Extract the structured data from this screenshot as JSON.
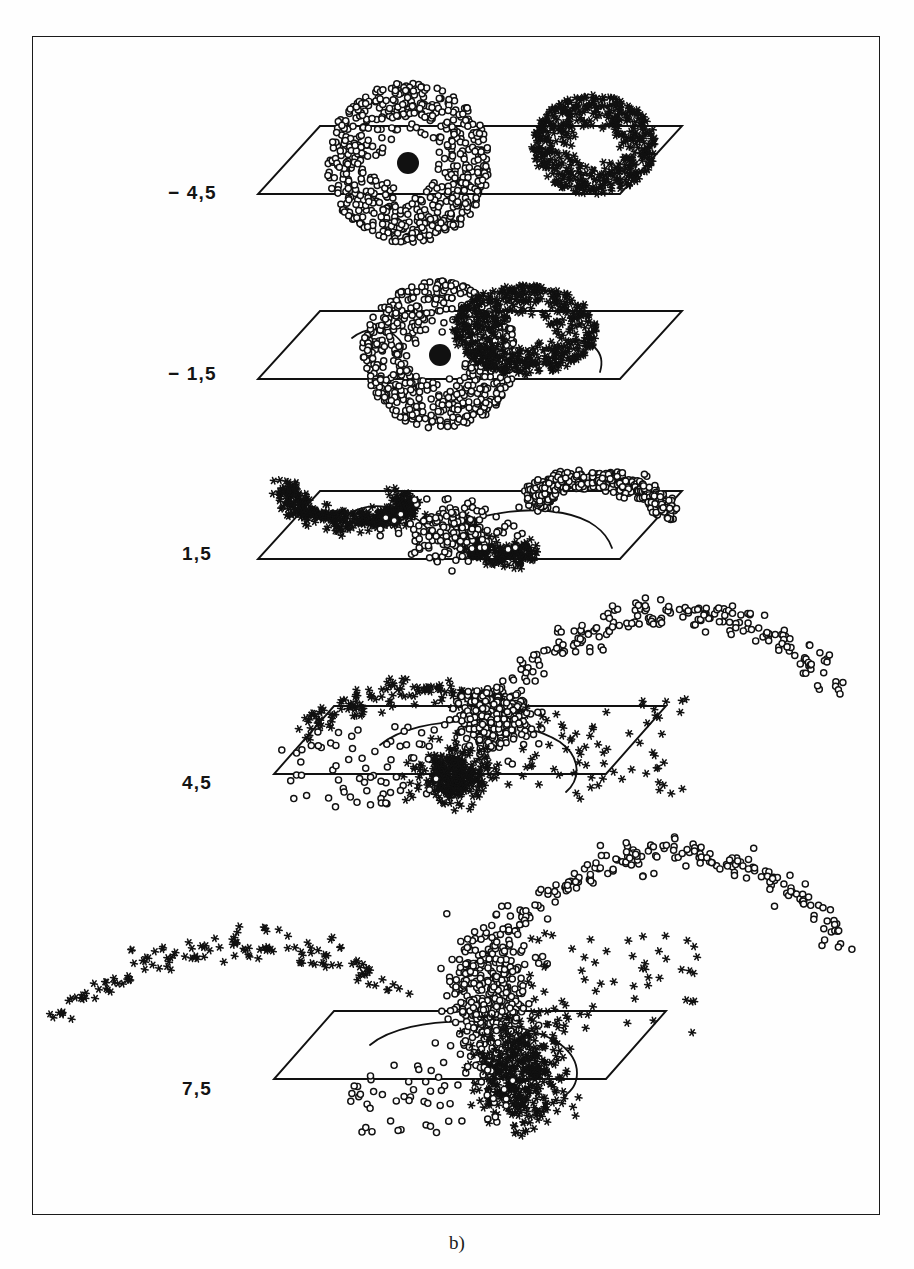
{
  "page": {
    "header_text": "",
    "caption": "b)",
    "background_color": "#fdfdfc",
    "ink_color": "#111111",
    "frame": {
      "color": "#1b1b1b"
    }
  },
  "figure": {
    "label": "b)",
    "type": "multi-panel 3d scatter",
    "marker_series": [
      {
        "name": "circles",
        "glyph": "open-circle",
        "color": "#111111"
      },
      {
        "name": "asterisks",
        "glyph": "six-point-asterisk",
        "color": "#111111"
      }
    ],
    "panel_value_label_prefix": "",
    "panels": [
      {
        "id": "panel-1",
        "label": "− 4,5",
        "value": -4.5
      },
      {
        "id": "panel-2",
        "label": "− 1,5",
        "value": -1.5
      },
      {
        "id": "panel-3",
        "label": "1,5",
        "value": 1.5
      },
      {
        "id": "panel-4",
        "label": "4,5",
        "value": 4.5
      },
      {
        "id": "panel-5",
        "label": "7,5",
        "value": 7.5
      }
    ]
  },
  "chart_data": {
    "type": "scatter",
    "title": "",
    "subtitle": "",
    "xlabel": "",
    "ylabel": "",
    "grid": false,
    "legend_position": "none",
    "annotations": [
      "− 4,5",
      "− 1,5",
      "1,5",
      "4,5",
      "7,5",
      "b)"
    ],
    "panel_parameter_values": [
      -4.5,
      -1.5,
      1.5,
      4.5,
      7.5
    ],
    "series": [
      {
        "name": "circles",
        "marker": "open-circle",
        "n_panels": 5
      },
      {
        "name": "asterisks",
        "marker": "six-point-asterisk",
        "n_panels": 5
      }
    ],
    "panels": [
      {
        "label": "− 4,5",
        "plane": {
          "cx": 470,
          "cy": 160,
          "hw": 212,
          "hh": 34,
          "skew": 62
        },
        "clusters": [
          {
            "series": "circles",
            "shape": "disc",
            "cx": 408,
            "cy": 163,
            "rx": 82,
            "ry": 80,
            "n": 620,
            "hole": 12,
            "core": 11
          },
          {
            "series": "asterisks",
            "shape": "disc",
            "cx": 594,
            "cy": 145,
            "rx": 62,
            "ry": 50,
            "n": 520,
            "hole": 0,
            "core": 0
          }
        ],
        "curves": [],
        "arcs": []
      },
      {
        "label": "− 1,5",
        "plane": {
          "cx": 470,
          "cy": 345,
          "hw": 212,
          "hh": 34,
          "skew": 62
        },
        "clusters": [
          {
            "series": "circles",
            "shape": "disc",
            "cx": 440,
            "cy": 355,
            "rx": 78,
            "ry": 74,
            "n": 600,
            "hole": 13,
            "core": 11
          },
          {
            "series": "asterisks",
            "shape": "disc",
            "cx": 525,
            "cy": 330,
            "rx": 72,
            "ry": 45,
            "n": 560,
            "hole": 0,
            "core": 0
          }
        ],
        "curves": [
          {
            "kind": "separatrix",
            "d": "M 352 338 C 372 322 398 330 404 348"
          },
          {
            "kind": "separatrix",
            "d": "M 566 340 C 592 338 606 352 600 372"
          }
        ],
        "arcs": []
      },
      {
        "label": "1,5",
        "plane": {
          "cx": 470,
          "cy": 525,
          "hw": 212,
          "hh": 34,
          "skew": 62
        },
        "clusters": [
          {
            "series": "asterisks",
            "shape": "arm-left",
            "cx": 385,
            "cy": 498,
            "n": 430
          },
          {
            "series": "circles",
            "shape": "arm-right",
            "cx": 560,
            "cy": 505,
            "n": 430
          },
          {
            "series": "asterisks",
            "shape": "arm-low",
            "cx": 530,
            "cy": 545,
            "n": 260
          },
          {
            "series": "circles",
            "shape": "blob",
            "cx": 455,
            "cy": 530,
            "n": 180
          }
        ],
        "curves": [
          {
            "kind": "separatrix",
            "d": "M 352 512 C 380 498 420 512 432 536"
          },
          {
            "kind": "separatrix",
            "d": "M 470 520 C 540 500 600 512 612 548"
          }
        ],
        "arcs": []
      },
      {
        "label": "4,5",
        "plane": {
          "cx": 470,
          "cy": 740,
          "hw": 196,
          "hh": 34,
          "skew": 60
        },
        "clusters": [
          {
            "series": "circles",
            "shape": "core",
            "cx": 495,
            "cy": 720,
            "rx": 38,
            "ry": 34,
            "n": 340
          },
          {
            "series": "asterisks",
            "shape": "core",
            "cx": 455,
            "cy": 775,
            "rx": 40,
            "ry": 28,
            "n": 330
          },
          {
            "series": "asterisks",
            "shape": "spray-right",
            "cx": 570,
            "cy": 740,
            "n": 70
          },
          {
            "series": "circles",
            "shape": "spray-left",
            "cx": 370,
            "cy": 765,
            "n": 70
          }
        ],
        "curves": [
          {
            "kind": "separatrix",
            "d": "M 380 745 C 420 712 520 716 560 742 C 582 758 580 780 566 792"
          }
        ],
        "arcs": [
          {
            "series": "circles",
            "n": 170,
            "x0": 468,
            "x1": 838,
            "ytop": 612,
            "ybot": 730,
            "dir": "right"
          },
          {
            "series": "asterisks",
            "n": 120,
            "x0": 300,
            "x1": 520,
            "ytop": 690,
            "ybot": 735,
            "dir": "left"
          }
        ]
      },
      {
        "label": "7,5",
        "plane": {
          "cx": 470,
          "cy": 1045,
          "hw": 196,
          "hh": 34,
          "skew": 60
        },
        "clusters": [
          {
            "series": "circles",
            "shape": "column",
            "cx": 490,
            "cy": 1000,
            "rx": 34,
            "ry": 62,
            "n": 380
          },
          {
            "series": "asterisks",
            "shape": "column",
            "cx": 520,
            "cy": 1075,
            "rx": 40,
            "ry": 48,
            "n": 380
          },
          {
            "series": "asterisks",
            "shape": "spray-right",
            "cx": 580,
            "cy": 975,
            "n": 60
          },
          {
            "series": "circles",
            "shape": "spray-low",
            "cx": 420,
            "cy": 1090,
            "n": 60
          }
        ],
        "curves": [
          {
            "kind": "separatrix",
            "d": "M 370 1045 C 410 1012 520 1016 560 1044 C 584 1062 580 1086 564 1096"
          }
        ],
        "arcs": [
          {
            "series": "circles",
            "n": 175,
            "x0": 455,
            "x1": 845,
            "ytop": 852,
            "ybot": 1000,
            "dir": "right"
          },
          {
            "series": "asterisks",
            "n": 110,
            "x0": 55,
            "x1": 400,
            "ytop": 945,
            "ybot": 1020,
            "dir": "left"
          }
        ]
      }
    ]
  },
  "row_labels": [
    {
      "text": "− 4,5",
      "x": 168,
      "y": 182
    },
    {
      "text": "− 1,5",
      "x": 168,
      "y": 363
    },
    {
      "text": "1,5",
      "x": 182,
      "y": 543
    },
    {
      "text": "4,5",
      "x": 182,
      "y": 772
    },
    {
      "text": "7,5",
      "x": 182,
      "y": 1078
    }
  ]
}
